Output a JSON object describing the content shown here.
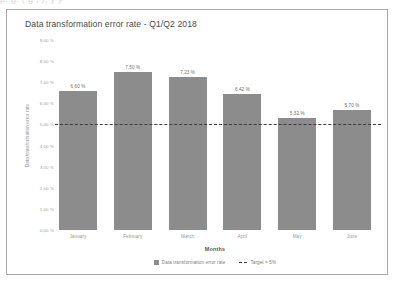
{
  "page_bleed_text": "p.      g.         ( g ,     ),             y     y",
  "chart_data": {
    "type": "bar",
    "title": "Data transformation error rate - Q1/Q2 2018",
    "xlabel": "Months",
    "ylabel": "Data transformation error rate",
    "categories": [
      "January",
      "February",
      "March",
      "April",
      "May",
      "June"
    ],
    "values": [
      6.6,
      7.5,
      7.23,
      6.42,
      5.32,
      5.7
    ],
    "value_labels": [
      "6,60 %",
      "7,50 %",
      "7,23 %",
      "6,42 %",
      "5,32 %",
      "5,70 %"
    ],
    "ylim": [
      0,
      9
    ],
    "ytick_values": [
      0,
      1,
      2,
      3,
      4,
      5,
      6,
      7,
      8,
      9
    ],
    "ytick_labels": [
      "0,00 %",
      "1,00 %",
      "2,00 %",
      "3,00 %",
      "4,00 %",
      "5,00 %",
      "6,00 %",
      "7,00 %",
      "8,00 %",
      "9,00 %"
    ],
    "grid": false,
    "legend_position": "bottom",
    "series": [
      {
        "name": "Data transformation error rate",
        "type": "bar",
        "color": "#8c8c8c",
        "values": [
          6.6,
          7.5,
          7.23,
          6.42,
          5.32,
          5.7
        ]
      },
      {
        "name": "Target = 5%",
        "type": "threshold-line",
        "color": "#3b3b3b",
        "style": "dashed",
        "value": 5.0
      }
    ],
    "legend": [
      {
        "label": "Data transformation error rate",
        "marker": "square",
        "color": "#8c8c8c"
      },
      {
        "label": "Target = 5%",
        "marker": "dashed-line",
        "color": "#3b3b3b"
      }
    ]
  },
  "colors": {
    "bar": "#8c8c8c",
    "target_line": "#3b3b3b",
    "frame_border": "#a9a9a9",
    "title_text": "#4a4a4a",
    "tick_text": "#9a9a9a",
    "background": "#ffffff"
  }
}
